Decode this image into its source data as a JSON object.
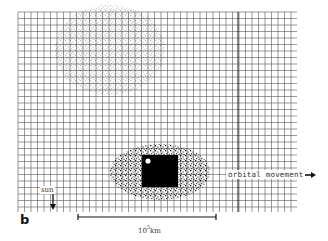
{
  "figure": {
    "panel_label": "b",
    "labels": {
      "sun": "sun",
      "orbital_movement": "orbital movement",
      "scale_base": "10",
      "scale_exponent": "5",
      "scale_unit": "km"
    },
    "icons": {
      "sun_arrow": "arrow-down",
      "orbital_arrow": "arrow-right"
    },
    "grid": {
      "x0": 18,
      "y0": 12,
      "x1": 297,
      "y1": 212,
      "cell": 6.5,
      "line_color": "#555555"
    },
    "nucleus": {
      "x": 142,
      "y": 155,
      "w": 36,
      "h": 32,
      "color": "#000000",
      "highlight": {
        "cx": 148,
        "cy": 161,
        "r": 2.6,
        "color": "#ffffff"
      }
    },
    "scale_bar": {
      "x1": 78,
      "x2": 216,
      "y": 217
    },
    "colors": {
      "background": "#ffffff",
      "ink": "#111111"
    }
  }
}
